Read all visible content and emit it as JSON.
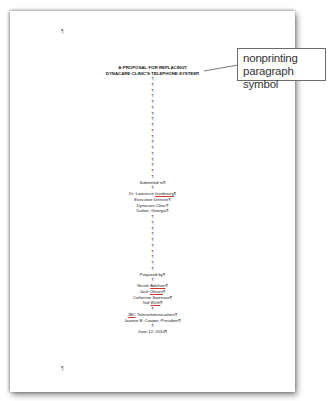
{
  "document": {
    "top_pilcrow": "¶",
    "bottom_pilcrow": "¶",
    "title_line1": "A·PROPOSAL·FOR·REPLACING¶",
    "title_line2": "DYNACARE·CLINIC'S·TELEPHONE·SYSTEM¶",
    "pilcrow": "¶",
    "submitted_to": "Submitted·to¶",
    "recipient": {
      "name_prefix": "Dr.·Lawrence·",
      "name_last": "Isenbourg",
      "name_suffix": "¶",
      "title": "Executive·Director¶",
      "organization": "Dynacare·Clinic¶",
      "location": "Dalton,·Georgia¶"
    },
    "prepared_by": "Prepared·by¶",
    "authors": [
      {
        "prefix": "Nicole·",
        "underlined": "Adelson",
        "suffix": "¶"
      },
      {
        "prefix": "Jack·",
        "underlined": "Olesen",
        "suffix": "¶"
      },
      {
        "prefix": "Catherine·Swenson¶",
        "underlined": "",
        "suffix": ""
      },
      {
        "prefix": "Ted·",
        "underlined": "Wirth",
        "suffix": "¶"
      }
    ],
    "company": {
      "underlined": "JBC",
      "rest": "·Telecommunications¶"
    },
    "president": "Joanne·B.·Cooper,·President¶",
    "date": "June·12,·2014¶"
  },
  "callout": {
    "line1": "nonprinting",
    "line2": "paragraph symbol",
    "border_color": "#6b6b6b",
    "text_color": "#333333"
  }
}
